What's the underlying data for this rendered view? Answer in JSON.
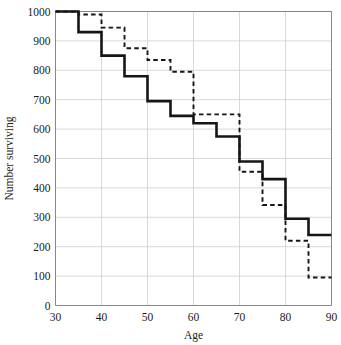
{
  "chart_data": {
    "type": "line",
    "title": "",
    "xlabel": "Age",
    "ylabel": "Number surviving",
    "xlim": [
      30,
      90
    ],
    "ylim": [
      0,
      1000
    ],
    "xticks": [
      30,
      40,
      50,
      60,
      70,
      80,
      90
    ],
    "yticks": [
      0,
      100,
      200,
      300,
      400,
      500,
      600,
      700,
      800,
      900,
      1000
    ],
    "xtick_labels": [
      "30",
      "40",
      "50",
      "60",
      "70",
      "80",
      "90"
    ],
    "ytick_labels": [
      "0",
      "100",
      "200",
      "300",
      "400",
      "500",
      "600",
      "700",
      "800",
      "900",
      "1000"
    ],
    "grid": true,
    "legend": "none",
    "step_interpolation": "post",
    "x_bin_edges": [
      30,
      35,
      40,
      45,
      50,
      55,
      60,
      65,
      70,
      75,
      80,
      85,
      90
    ],
    "series": [
      {
        "name": "solid-series",
        "style": "solid",
        "color": "#161616",
        "values": [
          1000,
          930,
          850,
          780,
          695,
          645,
          620,
          575,
          490,
          430,
          295,
          240
        ]
      },
      {
        "name": "dashed-series",
        "style": "dashed",
        "color": "#161616",
        "values": [
          1000,
          990,
          945,
          875,
          835,
          795,
          650,
          650,
          455,
          342,
          220,
          95
        ]
      }
    ]
  },
  "axes": {
    "x_axis_label": "Age",
    "y_axis_label": "Number surviving"
  }
}
